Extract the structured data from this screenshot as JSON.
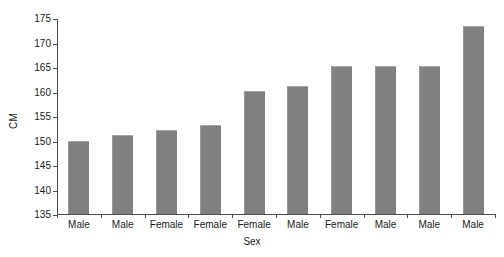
{
  "chart_data": {
    "type": "bar",
    "title": "",
    "xlabel": "Sex",
    "ylabel": "CM",
    "categories": [
      "Male",
      "Male",
      "Female",
      "Female",
      "Female",
      "Male",
      "Female",
      "Male",
      "Male",
      "Male"
    ],
    "values": [
      150.0,
      151.1,
      152.1,
      153.1,
      160.1,
      161.2,
      165.2,
      165.2,
      165.2,
      173.3
    ],
    "ylim": [
      135,
      175
    ],
    "yticks": [
      135,
      140,
      145,
      150,
      155,
      160,
      165,
      170,
      175
    ],
    "ytick_labels": [
      "135",
      "140",
      "145",
      "150",
      "155",
      "160",
      "165",
      "170",
      "175"
    ],
    "grid": false,
    "legend": null,
    "bar_color": "#808080",
    "axis_color": "#4d4d4d",
    "background": "#ffffff"
  },
  "figure": {
    "caption_remnant": ""
  }
}
